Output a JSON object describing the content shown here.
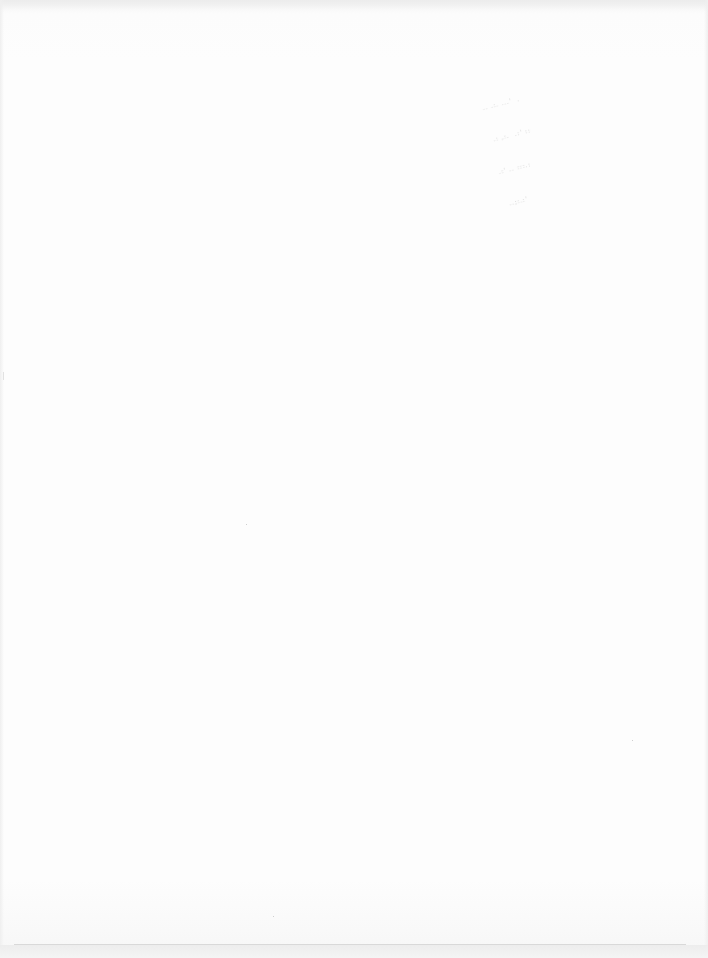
{
  "document": {
    "type": "scanned-blank-page",
    "background_color": "#fdfdfd",
    "bleed_through_lines": [
      ".. .:. ...'  .",
      " .: ,:.  .:' ::",
      ".:' .. :::.:",
      " ..;:.:'"
    ]
  }
}
